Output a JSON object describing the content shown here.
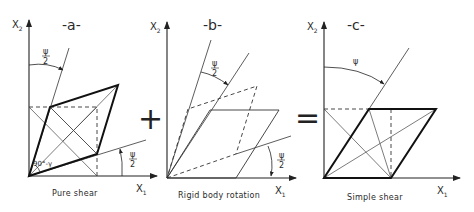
{
  "figure": {
    "panels": [
      {
        "id": "a",
        "title": "-a-",
        "caption": "Pure shear",
        "x_axis": "X",
        "x_sub": "1",
        "y_axis": "X",
        "y_sub": "2",
        "angle_top": {
          "num": "ψ",
          "den": "2"
        },
        "angle_bottom": {
          "num": "ψ",
          "den": "2"
        },
        "corner_angle": "90°-γ"
      },
      {
        "id": "b",
        "title": "-b-",
        "caption": "Rigid body rotation",
        "x_axis": "X",
        "x_sub": "1",
        "y_axis": "X",
        "y_sub": "2",
        "angle_top": {
          "num": "ψ",
          "den": "2"
        },
        "angle_bottom": {
          "num": "ψ",
          "den": "2"
        }
      },
      {
        "id": "c",
        "title": "-c-",
        "caption": "Simple shear",
        "x_axis": "X",
        "x_sub": "1",
        "y_axis": "X",
        "y_sub": "2",
        "angle_top": "ψ"
      }
    ],
    "operators": [
      "+",
      "="
    ]
  }
}
